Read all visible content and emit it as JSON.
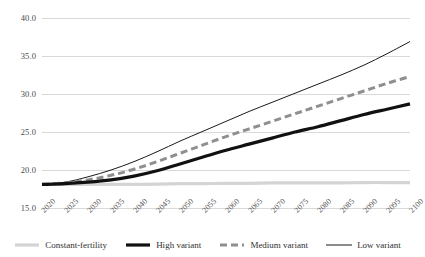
{
  "chart_data": {
    "type": "line",
    "title": "",
    "xlabel": "",
    "ylabel": "",
    "x": [
      2020,
      2025,
      2030,
      2035,
      2040,
      2045,
      2050,
      2055,
      2060,
      2065,
      2070,
      2075,
      2080,
      2085,
      2090,
      2095,
      2100
    ],
    "xtick_labels": [
      "2020",
      "2025",
      "2030",
      "2035",
      "2040",
      "2045",
      "2050",
      "2055",
      "2060",
      "2065",
      "2070",
      "2075",
      "2080",
      "2085",
      "2090",
      "2095",
      "2100"
    ],
    "ytick_labels": [
      "40.0",
      "35.0",
      "30.0",
      "25.0",
      "20.0",
      "15.0"
    ],
    "yticks": [
      40.0,
      35.0,
      30.0,
      25.0,
      20.0,
      15.0
    ],
    "ylim": [
      15.0,
      40.0
    ],
    "xlim": [
      2020,
      2100
    ],
    "grid": true,
    "legend_position": "bottom",
    "series": [
      {
        "name": "Constant-fertility",
        "style": "solid-thick",
        "color": "#d4d4d4",
        "values": [
          18.1,
          18.1,
          18.1,
          18.1,
          18.1,
          18.15,
          18.2,
          18.2,
          18.25,
          18.25,
          18.3,
          18.3,
          18.3,
          18.3,
          18.35,
          18.35,
          18.35
        ]
      },
      {
        "name": "High variant",
        "style": "solid-thick",
        "color": "#111111",
        "values": [
          18.1,
          18.2,
          18.4,
          18.7,
          19.2,
          19.9,
          20.8,
          21.7,
          22.6,
          23.4,
          24.2,
          25.0,
          25.7,
          26.5,
          27.3,
          28.0,
          28.7
        ]
      },
      {
        "name": "Medium variant",
        "style": "dashed",
        "color": "#8f8f8f",
        "values": [
          18.1,
          18.3,
          18.7,
          19.3,
          20.1,
          21.1,
          22.2,
          23.3,
          24.4,
          25.4,
          26.4,
          27.4,
          28.4,
          29.4,
          30.4,
          31.4,
          32.3
        ]
      },
      {
        "name": "Low variant",
        "style": "solid-thin",
        "color": "#1a1a1a",
        "values": [
          18.1,
          18.4,
          19.1,
          20.0,
          21.1,
          22.4,
          23.8,
          25.1,
          26.4,
          27.7,
          28.9,
          30.1,
          31.3,
          32.5,
          33.8,
          35.3,
          36.9
        ]
      }
    ]
  },
  "legend": {
    "items": [
      {
        "label": "Constant-fertility",
        "icon": "legend-swatch-solid-thick-light"
      },
      {
        "label": "High variant",
        "icon": "legend-swatch-solid-thick-black"
      },
      {
        "label": "Medium variant",
        "icon": "legend-swatch-dashed-gray"
      },
      {
        "label": "Low variant",
        "icon": "legend-swatch-solid-thin-black"
      }
    ]
  },
  "colors": {
    "gridline": "#d9d9d9",
    "constant_fertility": "#d4d4d4",
    "high_variant": "#111111",
    "medium_variant": "#8f8f8f",
    "low_variant": "#1a1a1a",
    "tick_text": "#555555"
  }
}
